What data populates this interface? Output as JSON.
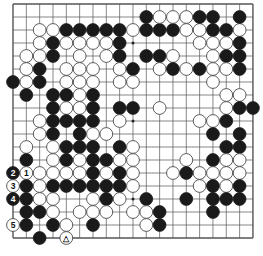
{
  "board": {
    "size": 19,
    "origin_x": 13,
    "origin_y": 4,
    "step_x": 13.33,
    "step_y": 13,
    "stone_radius": 6.4,
    "colors": {
      "black": "#1a1a1a",
      "white": "#ffffff",
      "line": "#555555",
      "stone_edge": "#333333"
    },
    "star_points": [
      [
        3,
        3
      ],
      [
        3,
        9
      ],
      [
        3,
        15
      ],
      [
        9,
        3
      ],
      [
        9,
        9
      ],
      [
        9,
        15
      ],
      [
        15,
        3
      ],
      [
        15,
        9
      ],
      [
        15,
        15
      ]
    ]
  },
  "stones": [
    {
      "c": "W",
      "x": 2,
      "y": 2
    },
    {
      "c": "W",
      "x": 3,
      "y": 2
    },
    {
      "c": "B",
      "x": 4,
      "y": 2
    },
    {
      "c": "B",
      "x": 5,
      "y": 2
    },
    {
      "c": "B",
      "x": 6,
      "y": 2
    },
    {
      "c": "B",
      "x": 7,
      "y": 2
    },
    {
      "c": "B",
      "x": 8,
      "y": 2
    },
    {
      "c": "W",
      "x": 9,
      "y": 2
    },
    {
      "c": "B",
      "x": 10,
      "y": 2
    },
    {
      "c": "B",
      "x": 11,
      "y": 2
    },
    {
      "c": "B",
      "x": 12,
      "y": 2
    },
    {
      "c": "W",
      "x": 13,
      "y": 2
    },
    {
      "c": "W",
      "x": 14,
      "y": 2
    },
    {
      "c": "B",
      "x": 15,
      "y": 2
    },
    {
      "c": "B",
      "x": 16,
      "y": 2
    },
    {
      "c": "W",
      "x": 17,
      "y": 2
    },
    {
      "c": "B",
      "x": 10,
      "y": 1
    },
    {
      "c": "W",
      "x": 11,
      "y": 1
    },
    {
      "c": "W",
      "x": 12,
      "y": 1
    },
    {
      "c": "W",
      "x": 13,
      "y": 1
    },
    {
      "c": "B",
      "x": 14,
      "y": 1
    },
    {
      "c": "B",
      "x": 15,
      "y": 1
    },
    {
      "c": "B",
      "x": 17,
      "y": 1
    },
    {
      "c": "W",
      "x": 2,
      "y": 3
    },
    {
      "c": "B",
      "x": 3,
      "y": 3
    },
    {
      "c": "W",
      "x": 4,
      "y": 3
    },
    {
      "c": "W",
      "x": 5,
      "y": 3
    },
    {
      "c": "W",
      "x": 6,
      "y": 3
    },
    {
      "c": "W",
      "x": 7,
      "y": 3
    },
    {
      "c": "B",
      "x": 8,
      "y": 3
    },
    {
      "c": "W",
      "x": 14,
      "y": 3
    },
    {
      "c": "W",
      "x": 15,
      "y": 3
    },
    {
      "c": "W",
      "x": 16,
      "y": 3
    },
    {
      "c": "B",
      "x": 17,
      "y": 3
    },
    {
      "c": "W",
      "x": 1,
      "y": 4
    },
    {
      "c": "W",
      "x": 2,
      "y": 4
    },
    {
      "c": "B",
      "x": 3,
      "y": 4
    },
    {
      "c": "W",
      "x": 5,
      "y": 4
    },
    {
      "c": "W",
      "x": 7,
      "y": 4
    },
    {
      "c": "B",
      "x": 8,
      "y": 4
    },
    {
      "c": "B",
      "x": 10,
      "y": 4
    },
    {
      "c": "B",
      "x": 11,
      "y": 4
    },
    {
      "c": "W",
      "x": 12,
      "y": 4
    },
    {
      "c": "W",
      "x": 15,
      "y": 4
    },
    {
      "c": "B",
      "x": 16,
      "y": 4
    },
    {
      "c": "B",
      "x": 17,
      "y": 4
    },
    {
      "c": "W",
      "x": 1,
      "y": 5
    },
    {
      "c": "B",
      "x": 2,
      "y": 5
    },
    {
      "c": "W",
      "x": 4,
      "y": 5
    },
    {
      "c": "W",
      "x": 5,
      "y": 5
    },
    {
      "c": "W",
      "x": 6,
      "y": 5
    },
    {
      "c": "W",
      "x": 8,
      "y": 5
    },
    {
      "c": "B",
      "x": 9,
      "y": 5
    },
    {
      "c": "W",
      "x": 11,
      "y": 5
    },
    {
      "c": "B",
      "x": 12,
      "y": 5
    },
    {
      "c": "W",
      "x": 13,
      "y": 5
    },
    {
      "c": "B",
      "x": 14,
      "y": 5
    },
    {
      "c": "W",
      "x": 15,
      "y": 5
    },
    {
      "c": "W",
      "x": 16,
      "y": 5
    },
    {
      "c": "B",
      "x": 17,
      "y": 5
    },
    {
      "c": "B",
      "x": 0,
      "y": 6
    },
    {
      "c": "W",
      "x": 1,
      "y": 6
    },
    {
      "c": "B",
      "x": 2,
      "y": 6
    },
    {
      "c": "W",
      "x": 4,
      "y": 6
    },
    {
      "c": "W",
      "x": 5,
      "y": 6
    },
    {
      "c": "W",
      "x": 6,
      "y": 6
    },
    {
      "c": "W",
      "x": 8,
      "y": 6
    },
    {
      "c": "W",
      "x": 9,
      "y": 6
    },
    {
      "c": "W",
      "x": 15,
      "y": 6
    },
    {
      "c": "B",
      "x": 1,
      "y": 7
    },
    {
      "c": "B",
      "x": 3,
      "y": 7
    },
    {
      "c": "B",
      "x": 4,
      "y": 7
    },
    {
      "c": "W",
      "x": 5,
      "y": 7
    },
    {
      "c": "B",
      "x": 6,
      "y": 7
    },
    {
      "c": "W",
      "x": 16,
      "y": 7
    },
    {
      "c": "W",
      "x": 17,
      "y": 7
    },
    {
      "c": "B",
      "x": 3,
      "y": 8
    },
    {
      "c": "W",
      "x": 4,
      "y": 8
    },
    {
      "c": "W",
      "x": 5,
      "y": 8
    },
    {
      "c": "B",
      "x": 6,
      "y": 8
    },
    {
      "c": "B",
      "x": 8,
      "y": 8
    },
    {
      "c": "B",
      "x": 9,
      "y": 8
    },
    {
      "c": "W",
      "x": 11,
      "y": 8
    },
    {
      "c": "W",
      "x": 16,
      "y": 8
    },
    {
      "c": "B",
      "x": 17,
      "y": 8
    },
    {
      "c": "B",
      "x": 18,
      "y": 8
    },
    {
      "c": "W",
      "x": 2,
      "y": 9
    },
    {
      "c": "B",
      "x": 3,
      "y": 9
    },
    {
      "c": "B",
      "x": 4,
      "y": 9
    },
    {
      "c": "B",
      "x": 5,
      "y": 9
    },
    {
      "c": "B",
      "x": 6,
      "y": 9
    },
    {
      "c": "W",
      "x": 8,
      "y": 9
    },
    {
      "c": "W",
      "x": 14,
      "y": 9
    },
    {
      "c": "W",
      "x": 15,
      "y": 9
    },
    {
      "c": "B",
      "x": 16,
      "y": 9
    },
    {
      "c": "W",
      "x": 2,
      "y": 10
    },
    {
      "c": "B",
      "x": 3,
      "y": 10
    },
    {
      "c": "B",
      "x": 5,
      "y": 10
    },
    {
      "c": "W",
      "x": 6,
      "y": 10
    },
    {
      "c": "W",
      "x": 7,
      "y": 10
    },
    {
      "c": "B",
      "x": 15,
      "y": 10
    },
    {
      "c": "B",
      "x": 17,
      "y": 10
    },
    {
      "c": "W",
      "x": 1,
      "y": 11
    },
    {
      "c": "W",
      "x": 3,
      "y": 11
    },
    {
      "c": "B",
      "x": 4,
      "y": 11
    },
    {
      "c": "B",
      "x": 5,
      "y": 11
    },
    {
      "c": "B",
      "x": 6,
      "y": 11
    },
    {
      "c": "B",
      "x": 8,
      "y": 11
    },
    {
      "c": "W",
      "x": 9,
      "y": 11
    },
    {
      "c": "B",
      "x": 16,
      "y": 11
    },
    {
      "c": "B",
      "x": 17,
      "y": 11
    },
    {
      "c": "B",
      "x": 1,
      "y": 12
    },
    {
      "c": "W",
      "x": 3,
      "y": 12
    },
    {
      "c": "B",
      "x": 4,
      "y": 12
    },
    {
      "c": "W",
      "x": 5,
      "y": 12
    },
    {
      "c": "B",
      "x": 6,
      "y": 12
    },
    {
      "c": "B",
      "x": 7,
      "y": 12
    },
    {
      "c": "W",
      "x": 8,
      "y": 12
    },
    {
      "c": "W",
      "x": 9,
      "y": 12
    },
    {
      "c": "W",
      "x": 13,
      "y": 12
    },
    {
      "c": "B",
      "x": 15,
      "y": 12
    },
    {
      "c": "W",
      "x": 16,
      "y": 12
    },
    {
      "c": "W",
      "x": 17,
      "y": 12
    },
    {
      "c": "B",
      "x": 0,
      "y": 13,
      "label": "2"
    },
    {
      "c": "W",
      "x": 1,
      "y": 13,
      "label": "1"
    },
    {
      "c": "W",
      "x": 2,
      "y": 13
    },
    {
      "c": "W",
      "x": 3,
      "y": 13
    },
    {
      "c": "W",
      "x": 4,
      "y": 13
    },
    {
      "c": "W",
      "x": 5,
      "y": 13
    },
    {
      "c": "B",
      "x": 6,
      "y": 13
    },
    {
      "c": "W",
      "x": 7,
      "y": 13
    },
    {
      "c": "B",
      "x": 8,
      "y": 13
    },
    {
      "c": "W",
      "x": 9,
      "y": 13
    },
    {
      "c": "W",
      "x": 12,
      "y": 13
    },
    {
      "c": "B",
      "x": 13,
      "y": 13
    },
    {
      "c": "W",
      "x": 14,
      "y": 13
    },
    {
      "c": "W",
      "x": 15,
      "y": 13
    },
    {
      "c": "W",
      "x": 16,
      "y": 13
    },
    {
      "c": "W",
      "x": 17,
      "y": 13
    },
    {
      "c": "W",
      "x": 0,
      "y": 14,
      "label": "3"
    },
    {
      "c": "B",
      "x": 1,
      "y": 14
    },
    {
      "c": "W",
      "x": 2,
      "y": 14
    },
    {
      "c": "B",
      "x": 3,
      "y": 14
    },
    {
      "c": "B",
      "x": 4,
      "y": 14
    },
    {
      "c": "B",
      "x": 5,
      "y": 14
    },
    {
      "c": "B",
      "x": 6,
      "y": 14
    },
    {
      "c": "B",
      "x": 7,
      "y": 14
    },
    {
      "c": "B",
      "x": 8,
      "y": 14
    },
    {
      "c": "W",
      "x": 9,
      "y": 14
    },
    {
      "c": "W",
      "x": 14,
      "y": 14
    },
    {
      "c": "B",
      "x": 15,
      "y": 14
    },
    {
      "c": "W",
      "x": 16,
      "y": 14
    },
    {
      "c": "B",
      "x": 17,
      "y": 14
    },
    {
      "c": "B",
      "x": 0,
      "y": 15,
      "label": "4"
    },
    {
      "c": "B",
      "x": 1,
      "y": 15
    },
    {
      "c": "W",
      "x": 2,
      "y": 15
    },
    {
      "c": "W",
      "x": 3,
      "y": 15
    },
    {
      "c": "W",
      "x": 6,
      "y": 15
    },
    {
      "c": "B",
      "x": 7,
      "y": 15
    },
    {
      "c": "W",
      "x": 8,
      "y": 15
    },
    {
      "c": "B",
      "x": 10,
      "y": 15
    },
    {
      "c": "B",
      "x": 13,
      "y": 15
    },
    {
      "c": "B",
      "x": 15,
      "y": 15
    },
    {
      "c": "B",
      "x": 16,
      "y": 15
    },
    {
      "c": "B",
      "x": 17,
      "y": 15
    },
    {
      "c": "B",
      "x": 1,
      "y": 16
    },
    {
      "c": "B",
      "x": 2,
      "y": 16
    },
    {
      "c": "W",
      "x": 3,
      "y": 16
    },
    {
      "c": "W",
      "x": 5,
      "y": 16
    },
    {
      "c": "W",
      "x": 6,
      "y": 16
    },
    {
      "c": "W",
      "x": 7,
      "y": 16
    },
    {
      "c": "W",
      "x": 9,
      "y": 16
    },
    {
      "c": "W",
      "x": 10,
      "y": 16
    },
    {
      "c": "B",
      "x": 11,
      "y": 16
    },
    {
      "c": "B",
      "x": 15,
      "y": 16
    },
    {
      "c": "W",
      "x": 0,
      "y": 17,
      "label": "5"
    },
    {
      "c": "B",
      "x": 1,
      "y": 17
    },
    {
      "c": "B",
      "x": 3,
      "y": 17
    },
    {
      "c": "W",
      "x": 4,
      "y": 17
    },
    {
      "c": "B",
      "x": 6,
      "y": 17
    },
    {
      "c": "W",
      "x": 10,
      "y": 17
    },
    {
      "c": "B",
      "x": 11,
      "y": 17
    },
    {
      "c": "B",
      "x": 2,
      "y": 18
    },
    {
      "c": "W",
      "x": 4,
      "y": 18,
      "label": "△"
    }
  ]
}
